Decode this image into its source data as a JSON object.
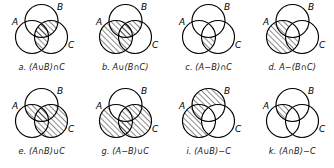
{
  "figure": {
    "kind": "venn-diagram-grid",
    "columns": 4,
    "rows": 2,
    "ink_color": "#000000",
    "background_color": "#ffffff",
    "hatch_color": "#000000",
    "hatch_style": "diagonal-lines-45deg-up-right",
    "set_labels": [
      "A",
      "B",
      "C"
    ],
    "panels": [
      {
        "id": "a",
        "caption": "a. (A∪B)∩C",
        "expression": "(A∪B)∩C",
        "label_a": "A",
        "label_b": "B",
        "label_c": "C",
        "shaded_regions": [
          "A∩C only",
          "A∩B∩C",
          "B∩C only"
        ]
      },
      {
        "id": "b",
        "caption": "b. A∪(B∩C)",
        "expression": "A∪(B∩C)",
        "label_a": "A",
        "label_b": "B",
        "label_c": "C",
        "shaded_regions": [
          "A only",
          "A∩B only",
          "A∩C only",
          "A∩B∩C",
          "B∩C only"
        ]
      },
      {
        "id": "c",
        "caption": "c. (A−B)∩C",
        "expression": "(A−B)∩C",
        "label_a": "A",
        "label_b": "B",
        "label_c": "C",
        "shaded_regions": [
          "A∩C only"
        ]
      },
      {
        "id": "d",
        "caption": "d. A−(B∩C)",
        "expression": "A−(B∩C)",
        "label_a": "A",
        "label_b": "B",
        "label_c": "C",
        "shaded_regions": [
          "A only",
          "A∩B only",
          "A∩C only"
        ]
      },
      {
        "id": "e",
        "caption": "e. (A∩B)∪C",
        "expression": "(A∩B)∪C",
        "label_a": "A",
        "label_b": "B",
        "label_c": "C",
        "shaded_regions": [
          "A∩B only",
          "A∩B∩C",
          "A∩C only",
          "B∩C only",
          "C only"
        ]
      },
      {
        "id": "g",
        "caption": "g. (A−B)∪C",
        "expression": "(A−B)∪C",
        "label_a": "A",
        "label_b": "B",
        "label_c": "C",
        "shaded_regions": [
          "A only",
          "A∩C only",
          "A∩B∩C",
          "B∩C only",
          "C only"
        ]
      },
      {
        "id": "i",
        "caption": "i. (A∪B)−C",
        "expression": "(A∪B)−C",
        "label_a": "A",
        "label_b": "B",
        "label_c": "C",
        "shaded_regions": [
          "A only",
          "B only",
          "A∩B only"
        ]
      },
      {
        "id": "k",
        "caption": "k. (A∩B)−C",
        "expression": "(A∩B)−C",
        "label_a": "A",
        "label_b": "B",
        "label_c": "C",
        "shaded_regions": [
          "A∩B only"
        ]
      }
    ]
  }
}
